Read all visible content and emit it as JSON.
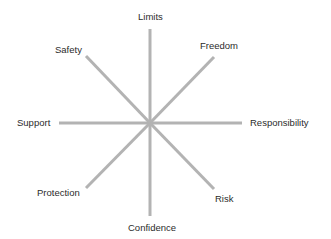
{
  "diagram": {
    "type": "radial-spoke",
    "line_color": "#b3b3b3",
    "text_color": "#2b2b2b",
    "center": {
      "x": 150,
      "y": 123
    },
    "spokes": [
      {
        "id": "limits",
        "label": "Limits",
        "x1": 150,
        "y1": 123,
        "x2": 150,
        "y2": 29
      },
      {
        "id": "freedom",
        "label": "Freedom",
        "x1": 150,
        "y1": 123,
        "x2": 214,
        "y2": 57
      },
      {
        "id": "responsibility",
        "label": "Responsibility",
        "x1": 150,
        "y1": 123,
        "x2": 242,
        "y2": 123
      },
      {
        "id": "risk",
        "label": "Risk",
        "x1": 150,
        "y1": 123,
        "x2": 214,
        "y2": 189
      },
      {
        "id": "confidence",
        "label": "Confidence",
        "x1": 150,
        "y1": 123,
        "x2": 150,
        "y2": 216
      },
      {
        "id": "protection",
        "label": "Protection",
        "x1": 150,
        "y1": 123,
        "x2": 86,
        "y2": 188
      },
      {
        "id": "support",
        "label": "Support",
        "x1": 150,
        "y1": 123,
        "x2": 59,
        "y2": 123
      },
      {
        "id": "safety",
        "label": "Safety",
        "x1": 150,
        "y1": 123,
        "x2": 86,
        "y2": 56
      }
    ]
  }
}
